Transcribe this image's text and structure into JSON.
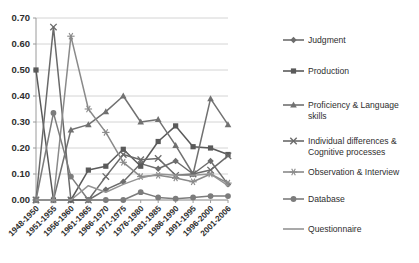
{
  "chart_data": {
    "type": "line",
    "title": "",
    "subtitle": "",
    "xlabel": "",
    "ylabel": "",
    "ylim": [
      0.0,
      0.7
    ],
    "ytick_labels": [
      "0.00",
      "0.10",
      "0.20",
      "0.30",
      "0.40",
      "0.50",
      "0.60",
      "0.70"
    ],
    "ytick_values": [
      0.0,
      0.1,
      0.2,
      0.3,
      0.4,
      0.5,
      0.6,
      0.7
    ],
    "grid": true,
    "legend_position": "right",
    "categories": [
      "1948-1950",
      "1951-1955",
      "1956-1960",
      "1961-1965",
      "1966-1970",
      "1971-1975",
      "1976-1980",
      "1981-1985",
      "1986-1990",
      "1991-1995",
      "1996-2000",
      "2001-2006"
    ],
    "series": [
      {
        "name": "Judgment",
        "marker": "diamond",
        "color": "#6d6d6d",
        "values": [
          0.0,
          0.0,
          0.0,
          0.0,
          0.04,
          0.07,
          0.14,
          0.12,
          0.15,
          0.1,
          0.15,
          0.06
        ]
      },
      {
        "name": "Production",
        "marker": "square",
        "color": "#5a5a5a",
        "values": [
          0.5,
          0.0,
          0.0,
          0.115,
          0.13,
          0.195,
          0.13,
          0.225,
          0.285,
          0.205,
          0.2,
          0.175
        ]
      },
      {
        "name": "Proficiency & Language skills",
        "marker": "triangle",
        "color": "#717171",
        "values": [
          0.0,
          0.0,
          0.27,
          0.29,
          0.34,
          0.4,
          0.3,
          0.31,
          0.21,
          0.1,
          0.39,
          0.29
        ]
      },
      {
        "name": "Individual differences & Cognitive processes",
        "marker": "cross",
        "color": "#6a6a6a",
        "values": [
          0.0,
          0.665,
          0.0,
          0.0,
          0.09,
          0.175,
          0.155,
          0.16,
          0.095,
          0.1,
          0.115,
          0.17
        ]
      },
      {
        "name": "Observation & Interview",
        "marker": "asterisk",
        "color": "#8a8a8a",
        "values": [
          0.0,
          0.0,
          0.63,
          0.35,
          0.26,
          0.145,
          0.09,
          0.095,
          0.085,
          0.07,
          0.1,
          0.065
        ]
      },
      {
        "name": "Database",
        "marker": "circle",
        "color": "#7c7c7c",
        "values": [
          0.0,
          0.335,
          0.09,
          0.0,
          0.0,
          0.0,
          0.03,
          0.01,
          0.005,
          0.01,
          0.015,
          0.015
        ]
      },
      {
        "name": "Questionnaire",
        "marker": "line",
        "color": "#949494",
        "values": [
          0.0,
          0.0,
          0.0,
          0.055,
          0.03,
          0.06,
          0.085,
          0.1,
          0.095,
          0.095,
          0.1,
          0.055
        ]
      }
    ]
  }
}
